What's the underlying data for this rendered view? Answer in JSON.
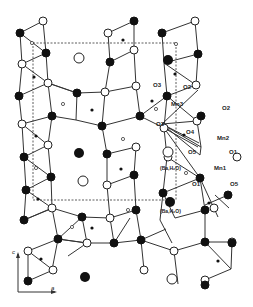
{
  "figure": {
    "type": "crystal-structure-projection",
    "projection_axes": {
      "vertical": "c",
      "horizontal": "a"
    },
    "legend": {
      "open_circle_large": "(Ba,H2O) at one height",
      "filled_circle_large": "(Ba,H2O) at other height",
      "open_circle": "oxygen (upper level)",
      "filled_circle": "oxygen (lower level)",
      "small_dot": "Mn"
    }
  },
  "labels": {
    "o3_top": "O3",
    "o2_top": "O2",
    "mn3": "Mn3",
    "o3_mid": "O3",
    "o4": "O4",
    "o2_right": "O2",
    "mn2": "Mn2",
    "o5_left": "O5",
    "o1_right": "O1",
    "mn1": "Mn1",
    "o1_low": "O1",
    "o5_right": "O5",
    "ba_h2o_open": "(Ba,H₂O)",
    "ba_h2o_filled": "(Ba,H₂O)",
    "axis_c": "c",
    "axis_a": "a"
  },
  "unit_cell": {
    "x": 33,
    "y": 43,
    "width": 143,
    "height": 157
  }
}
